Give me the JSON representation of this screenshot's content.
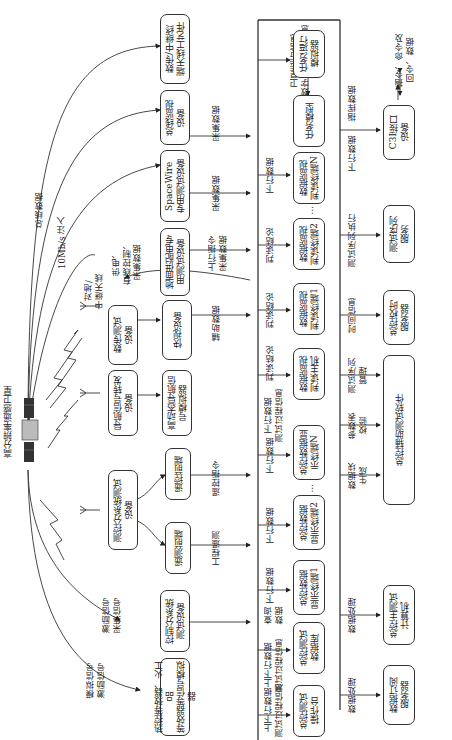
{
  "satellite": {
    "label": "高分辨率遥感卫星"
  },
  "left_links": {
    "bus_data": "总线数据",
    "injection_10mbps": "10Mb/s 注入",
    "power_wired_collect": "供电、\n有线控制、\n采集数据",
    "ground_relay_antenna": "对地/\n中继天线",
    "excitation_collect": "激励信号\n采集信号",
    "simulated_excitation": "模拟信号\n激励信号"
  },
  "equipment": [
    {
      "id": "relay_antenna_tool",
      "label": "数传/中继终\n端天线工艺件"
    },
    {
      "id": "bus_monitor",
      "label": "总线监视\n设备"
    },
    {
      "id": "spacewire",
      "label": "SpaceWire\n专用测试设备"
    },
    {
      "id": "ground_power",
      "label": "地面供配电专\n用测试设备"
    },
    {
      "id": "datatrans_test",
      "label": "数传测试\n设备"
    },
    {
      "id": "quicklook",
      "label": "快视设备"
    },
    {
      "id": "nav_forward",
      "label": "导航信号转发\n设备"
    },
    {
      "id": "nav_sim",
      "label": "高动态导航信\n号模拟器"
    },
    {
      "id": "ttc_test",
      "label": "测控分系统测试\n设备"
    },
    {
      "id": "tc_frontend",
      "label": "遥控前端"
    },
    {
      "id": "tm_frontend",
      "label": "遥测前端"
    },
    {
      "id": "ctrl_test",
      "label": "控制分系统\n测试设备"
    },
    {
      "id": "thermal_sim",
      "label": "热控等效器、火工品\n等效器等信号模拟器"
    }
  ],
  "equipment_links": {
    "bus_monitor": "采集数据",
    "spacewire": "采集数据",
    "ground_power": "上行指令\n采集数据",
    "quicklook": "辅助数据",
    "tc_frontend": "遥控指令",
    "tm_frontend": "工程遥测"
  },
  "core": {
    "top_label": "卫星运行信息\n数字卫星预估信息",
    "modules": [
      {
        "id": "task_runner",
        "label": "任务运行\n模拟器"
      },
      {
        "id": "task_model",
        "label": "任务模型"
      },
      {
        "id": "monitor_n",
        "label": "数据监视\n判读终端N",
        "link": "下行数据"
      },
      {
        "id": "monitor_2",
        "label": "数据监视\n判读终端2",
        "link": "判读结论"
      },
      {
        "id": "monitor_1",
        "label": "数据监视\n判读终端1",
        "link": "判读结论"
      },
      {
        "id": "monitor_host",
        "label": "数据监视\n判读主机",
        "link": "判读结论",
        "link2": "下行数据\n测试过程信息"
      },
      {
        "id": "display_n",
        "label": "总控数据显\n示终端N",
        "link": "下行数据"
      },
      {
        "id": "display_2",
        "label": "总控数据\n显示终端2",
        "link": "下行数据"
      },
      {
        "id": "display_1",
        "label": "总控数据\n显示终端1",
        "link": "下行数据"
      },
      {
        "id": "test_db",
        "label": "总控测试\n数据库",
        "link": "上下行数据\n测试过程信息",
        "link2": "查询\n数据"
      },
      {
        "id": "console",
        "label": "总控测试\n操作台",
        "link": "上下行数据\n测试过程信息"
      }
    ],
    "ellipsis": "…"
  },
  "services": [
    {
      "id": "c3i",
      "label": "C3I接口\n设备",
      "link": "下行数据",
      "link2": "指挥数据"
    },
    {
      "id": "sequence",
      "label": "测试序列\n服务",
      "link": "测试序列执行"
    },
    {
      "id": "timing",
      "label": "总控校时\n服务器",
      "link": "时间信息"
    },
    {
      "id": "aux_software",
      "label": "总控辅助测试软件",
      "links": [
        "测试序列\n管理",
        "参数表\n校验",
        "数据块\n生成"
      ]
    },
    {
      "id": "main_computer",
      "label": "总控主测试\n计算机",
      "link": "数据处理"
    },
    {
      "id": "subscription",
      "label": "数据订阅\n服务器",
      "link": "数据处理"
    }
  ],
  "external": {
    "label": "指令、命令及\n回令、数据"
  }
}
